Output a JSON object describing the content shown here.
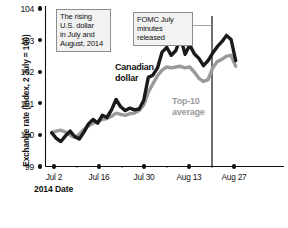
{
  "chart_data": {
    "type": "line",
    "title": "",
    "xlabel": "2014 Date",
    "ylabel": "Exchange rate (Index, 2 July = 100)",
    "ylim": [
      99,
      104
    ],
    "yticks": [
      99,
      100,
      101,
      102,
      103,
      104
    ],
    "xticks": [
      "Jul 2",
      "Jul 16",
      "Jul 30",
      "Aug 13",
      "Aug 27"
    ],
    "grid": false,
    "legend_position": "inline-labels",
    "x": [
      "Jul 2",
      "Jul 3",
      "Jul 4",
      "Jul 7",
      "Jul 8",
      "Jul 9",
      "Jul 10",
      "Jul 11",
      "Jul 14",
      "Jul 15",
      "Jul 16",
      "Jul 17",
      "Jul 18",
      "Jul 21",
      "Jul 22",
      "Jul 23",
      "Jul 24",
      "Jul 25",
      "Jul 28",
      "Jul 29",
      "Jul 30",
      "Jul 31",
      "Aug 1",
      "Aug 4",
      "Aug 5",
      "Aug 6",
      "Aug 7",
      "Aug 8",
      "Aug 11",
      "Aug 12",
      "Aug 13",
      "Aug 14",
      "Aug 15",
      "Aug 18",
      "Aug 19",
      "Aug 20",
      "Aug 21",
      "Aug 22",
      "Aug 25",
      "Aug 26",
      "Aug 27"
    ],
    "series": [
      {
        "name": "Canadian dollar",
        "color": "#1a1a1a",
        "values": [
          100.0,
          99.82,
          99.72,
          99.9,
          100.05,
          99.88,
          99.8,
          100.02,
          100.28,
          100.42,
          100.3,
          100.55,
          100.48,
          100.72,
          101.05,
          100.82,
          100.7,
          100.78,
          100.72,
          100.75,
          101.02,
          101.75,
          101.82,
          102.05,
          102.55,
          102.7,
          102.45,
          102.6,
          103.02,
          102.48,
          102.78,
          102.5,
          102.35,
          102.12,
          102.28,
          102.52,
          102.72,
          102.88,
          103.08,
          102.95,
          102.28
        ]
      },
      {
        "name": "Top-10 average",
        "color": "#9a9a9a",
        "values": [
          100.0,
          100.05,
          100.08,
          100.02,
          99.92,
          99.85,
          99.95,
          100.1,
          100.22,
          100.3,
          100.35,
          100.42,
          100.45,
          100.52,
          100.62,
          100.58,
          100.55,
          100.6,
          100.62,
          100.7,
          100.88,
          101.28,
          101.55,
          101.8,
          101.98,
          102.08,
          102.05,
          102.08,
          102.1,
          102.05,
          102.08,
          101.92,
          101.72,
          101.62,
          101.68,
          102.05,
          102.25,
          102.32,
          102.42,
          102.45,
          102.1
        ]
      }
    ],
    "annotations": [
      {
        "id": "rising-dollar-note",
        "text": "The rising\nU.S. dollar\nin July and\nAugust, 2014",
        "lines": [
          "The rising",
          "U.S. dollar",
          "in July and",
          "August, 2014"
        ]
      },
      {
        "id": "fomc-note",
        "text": "FOMC July\nminutes released",
        "lines": [
          "FOMC July",
          "minutes released"
        ],
        "marker_date": "Aug 20",
        "marker_type": "vertical-rule"
      }
    ],
    "series_labels": [
      {
        "name": "Canadian dollar",
        "lines": [
          "Canadian",
          "dollar"
        ],
        "color": "#111111"
      },
      {
        "name": "Top-10 average",
        "lines": [
          "Top-10",
          "average"
        ],
        "color": "#9a9a9a"
      }
    ]
  },
  "colors": {
    "canadian_dollar": "#1a1a1a",
    "top10_average": "#9a9a9a",
    "axis": "#111111",
    "callout_border": "#8d8d8d",
    "callout_fill": "#f2f2f2",
    "background": "#ffffff"
  }
}
